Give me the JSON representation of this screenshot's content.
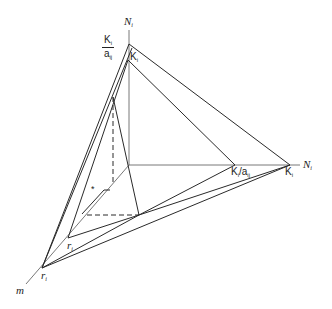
{
  "diagram": {
    "type": "3d-phase-space-ternary-axes",
    "colors": {
      "line": "#2a2a2a",
      "background": "#ffffff"
    },
    "axes": {
      "vertical": {
        "label": "N",
        "subscript": "i"
      },
      "horizontal": {
        "label": "N",
        "subscript": "i"
      },
      "diagonal": {
        "label": "m"
      }
    },
    "labels": {
      "top_frac_num": "K",
      "top_frac_num_sub": "i",
      "top_frac_den": "a",
      "top_frac_den_sub": "ij",
      "vertical_K": "K",
      "vertical_K_sub": "i",
      "horiz_Kfrac": "K",
      "horiz_Kfrac_sub": "i",
      "horiz_Kfrac_slash": "/a",
      "horiz_Kfrac_den_sub": "ij",
      "horiz_K": "K",
      "horiz_K_sub": "i",
      "r_inner": "r",
      "r_inner_sub": "i",
      "r_outer": "r",
      "r_outer_sub": "i",
      "star": "*"
    }
  }
}
